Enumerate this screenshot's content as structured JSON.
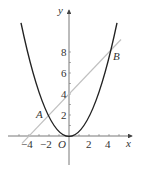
{
  "diagram": {
    "type": "function-graph",
    "axes": {
      "x_label": "x",
      "y_label": "y",
      "origin_label": "O",
      "x_ticks": [
        "−4",
        "−2",
        "2",
        "4"
      ],
      "y_ticks": [
        "2",
        "4",
        "6",
        "8"
      ]
    },
    "curves": [
      {
        "name": "parabola",
        "equation": "y = x²/2",
        "color": "#222222"
      },
      {
        "name": "line",
        "equation": "y = x + 4",
        "color": "#c0c0c0"
      }
    ],
    "points": [
      {
        "label": "A",
        "x": -2,
        "y": 2
      },
      {
        "label": "B",
        "x": 4,
        "y": 8
      }
    ]
  }
}
